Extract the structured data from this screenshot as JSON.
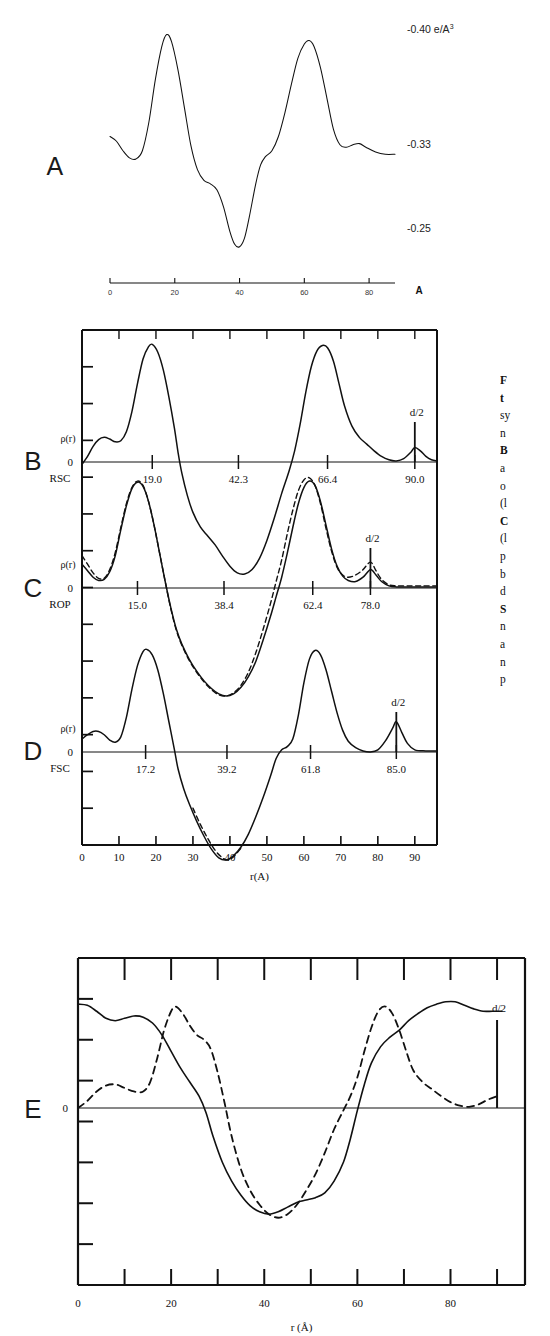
{
  "figure": {
    "title_letters": [
      "A",
      "B",
      "C",
      "D",
      "E"
    ],
    "axis_label_r": "r(A)",
    "axis_label_r_angstrom": "r (Å)",
    "zero_label": "0",
    "rho_label": "ρ(r)",
    "d_half_label": "d/2",
    "units_label": "-0.40 e/A",
    "units_exponent": "3"
  },
  "caption": {
    "lines": [
      "F",
      "t",
      "sy",
      "n",
      "B",
      "a",
      "o",
      "(l",
      "C",
      "(l",
      "p",
      "b",
      "d",
      "S",
      "n",
      "a",
      "n",
      "p"
    ],
    "bold_lines": [
      0,
      1,
      4,
      8,
      13
    ]
  },
  "panelA": {
    "letter": "A",
    "y_labels": [
      "-0.40 e/A",
      "-0.33",
      "-0.25"
    ],
    "y_label_sup": "3",
    "x_ticks": [
      0,
      20,
      40,
      60,
      80
    ],
    "x_tick_labels": [
      "0",
      "20",
      "40",
      "60",
      "80"
    ],
    "axis_unit": "A",
    "x_range": [
      0,
      88
    ],
    "curve": [
      [
        0,
        0.5
      ],
      [
        2,
        0.48
      ],
      [
        4,
        0.44
      ],
      [
        6,
        0.41
      ],
      [
        8,
        0.405
      ],
      [
        10,
        0.44
      ],
      [
        12,
        0.56
      ],
      [
        14,
        0.74
      ],
      [
        16,
        0.88
      ],
      [
        17.5,
        0.93
      ],
      [
        19,
        0.9
      ],
      [
        21,
        0.78
      ],
      [
        23,
        0.62
      ],
      [
        25,
        0.46
      ],
      [
        27,
        0.36
      ],
      [
        29,
        0.315
      ],
      [
        31,
        0.3
      ],
      [
        33,
        0.275
      ],
      [
        35,
        0.205
      ],
      [
        37,
        0.1
      ],
      [
        38.5,
        0.045
      ],
      [
        40,
        0.035
      ],
      [
        41.5,
        0.07
      ],
      [
        43,
        0.16
      ],
      [
        45,
        0.3
      ],
      [
        46.5,
        0.38
      ],
      [
        48,
        0.415
      ],
      [
        50,
        0.44
      ],
      [
        52,
        0.5
      ],
      [
        54,
        0.6
      ],
      [
        56,
        0.72
      ],
      [
        58,
        0.83
      ],
      [
        60,
        0.89
      ],
      [
        61.5,
        0.905
      ],
      [
        63,
        0.88
      ],
      [
        65,
        0.79
      ],
      [
        67,
        0.66
      ],
      [
        69,
        0.53
      ],
      [
        71,
        0.465
      ],
      [
        73,
        0.455
      ],
      [
        75,
        0.465
      ],
      [
        77,
        0.47
      ],
      [
        79,
        0.455
      ],
      [
        82,
        0.435
      ],
      [
        85,
        0.425
      ],
      [
        88,
        0.425
      ]
    ]
  },
  "panelB": {
    "letter": "B",
    "name": "RSC",
    "tick_values": [
      19.0,
      42.3,
      66.4,
      90.0
    ],
    "tick_labels": [
      "19.0",
      "42.3",
      "66.4",
      "90.0"
    ],
    "d_half": 90.0,
    "x_range": [
      0,
      96
    ],
    "y_range": [
      -1.0,
      1.15
    ],
    "curve": [
      [
        0,
        -0.02
      ],
      [
        1.5,
        0.05
      ],
      [
        3,
        0.14
      ],
      [
        4.5,
        0.2
      ],
      [
        6,
        0.22
      ],
      [
        7.5,
        0.205
      ],
      [
        9,
        0.18
      ],
      [
        10.5,
        0.19
      ],
      [
        12,
        0.27
      ],
      [
        13.5,
        0.45
      ],
      [
        15,
        0.7
      ],
      [
        16.5,
        0.92
      ],
      [
        18,
        1.03
      ],
      [
        19,
        1.05
      ],
      [
        20.5,
        0.98
      ],
      [
        22,
        0.82
      ],
      [
        23.5,
        0.58
      ],
      [
        25,
        0.3
      ],
      [
        26,
        0.08
      ],
      [
        27,
        -0.1
      ],
      [
        28.5,
        -0.3
      ],
      [
        30,
        -0.45
      ],
      [
        32,
        -0.58
      ],
      [
        34,
        -0.66
      ],
      [
        36,
        -0.74
      ],
      [
        38,
        -0.84
      ],
      [
        40,
        -0.93
      ],
      [
        42,
        -0.99
      ],
      [
        44,
        -1.0
      ],
      [
        46,
        -0.96
      ],
      [
        48,
        -0.86
      ],
      [
        50,
        -0.7
      ],
      [
        52,
        -0.5
      ],
      [
        54,
        -0.28
      ],
      [
        56,
        -0.08
      ],
      [
        57.5,
        0.1
      ],
      [
        59,
        0.34
      ],
      [
        60.5,
        0.62
      ],
      [
        62,
        0.85
      ],
      [
        63.5,
        0.99
      ],
      [
        65,
        1.04
      ],
      [
        66.4,
        1.02
      ],
      [
        68,
        0.9
      ],
      [
        69.5,
        0.7
      ],
      [
        71,
        0.5
      ],
      [
        73,
        0.32
      ],
      [
        75,
        0.22
      ],
      [
        77,
        0.16
      ],
      [
        79,
        0.1
      ],
      [
        81,
        0.05
      ],
      [
        83,
        0.02
      ],
      [
        85,
        0.01
      ],
      [
        87,
        0.03
      ],
      [
        89,
        0.09
      ],
      [
        90,
        0.13
      ],
      [
        91.5,
        0.1
      ],
      [
        93,
        0.05
      ],
      [
        94.5,
        0.02
      ],
      [
        96,
        0.01
      ]
    ]
  },
  "panelC": {
    "letter": "C",
    "name": "ROP",
    "tick_values": [
      15.0,
      38.4,
      62.4,
      78.0
    ],
    "tick_labels": [
      "15.0",
      "38.4",
      "62.4",
      "78.0"
    ],
    "d_half": 78.0,
    "x_range": [
      0,
      96
    ],
    "y_range": [
      -1.05,
      1.05
    ],
    "curve": [
      [
        0,
        0.22
      ],
      [
        1.5,
        0.16
      ],
      [
        3,
        0.1
      ],
      [
        4.5,
        0.07
      ],
      [
        6,
        0.08
      ],
      [
        7.5,
        0.15
      ],
      [
        9,
        0.3
      ],
      [
        10.5,
        0.54
      ],
      [
        12,
        0.76
      ],
      [
        13.5,
        0.92
      ],
      [
        15,
        0.98
      ],
      [
        16.5,
        0.94
      ],
      [
        18,
        0.8
      ],
      [
        19.5,
        0.58
      ],
      [
        21,
        0.32
      ],
      [
        22.5,
        0.06
      ],
      [
        24,
        -0.18
      ],
      [
        25.5,
        -0.38
      ],
      [
        27,
        -0.52
      ],
      [
        29,
        -0.66
      ],
      [
        31,
        -0.77
      ],
      [
        33,
        -0.86
      ],
      [
        35,
        -0.93
      ],
      [
        37,
        -0.98
      ],
      [
        39,
        -1.0
      ],
      [
        41,
        -0.98
      ],
      [
        43,
        -0.92
      ],
      [
        45,
        -0.82
      ],
      [
        47,
        -0.68
      ],
      [
        49,
        -0.48
      ],
      [
        51,
        -0.26
      ],
      [
        52.5,
        -0.08
      ],
      [
        54,
        0.1
      ],
      [
        55.5,
        0.32
      ],
      [
        57,
        0.56
      ],
      [
        58.5,
        0.78
      ],
      [
        60,
        0.93
      ],
      [
        61.5,
        0.99
      ],
      [
        63,
        0.95
      ],
      [
        64.5,
        0.8
      ],
      [
        66,
        0.58
      ],
      [
        67.5,
        0.36
      ],
      [
        69,
        0.2
      ],
      [
        70.5,
        0.11
      ],
      [
        72,
        0.07
      ],
      [
        74,
        0.06
      ],
      [
        76,
        0.1
      ],
      [
        78,
        0.17
      ],
      [
        79.5,
        0.12
      ],
      [
        81,
        0.06
      ],
      [
        83,
        0.02
      ],
      [
        85,
        0.01
      ],
      [
        88,
        0.01
      ],
      [
        92,
        0.01
      ],
      [
        96,
        0.01
      ]
    ],
    "curve_dashed": [
      [
        0,
        0.3
      ],
      [
        1.5,
        0.22
      ],
      [
        3,
        0.14
      ],
      [
        4.5,
        0.09
      ],
      [
        6,
        0.09
      ],
      [
        7.5,
        0.17
      ],
      [
        9,
        0.33
      ],
      [
        10.5,
        0.56
      ],
      [
        12,
        0.78
      ],
      [
        13.5,
        0.93
      ],
      [
        15,
        0.99
      ],
      [
        16.5,
        0.95
      ],
      [
        18,
        0.8
      ],
      [
        19.5,
        0.58
      ],
      [
        21,
        0.32
      ],
      [
        22.5,
        0.06
      ],
      [
        24,
        -0.19
      ],
      [
        25.5,
        -0.39
      ],
      [
        27,
        -0.53
      ],
      [
        29,
        -0.67
      ],
      [
        31,
        -0.78
      ],
      [
        33,
        -0.87
      ],
      [
        35,
        -0.94
      ],
      [
        37,
        -0.99
      ],
      [
        39,
        -1.0
      ],
      [
        41,
        -0.97
      ],
      [
        43,
        -0.9
      ],
      [
        45,
        -0.78
      ],
      [
        47,
        -0.6
      ],
      [
        49,
        -0.38
      ],
      [
        51,
        -0.14
      ],
      [
        52.5,
        0.06
      ],
      [
        54,
        0.26
      ],
      [
        55.5,
        0.5
      ],
      [
        57,
        0.72
      ],
      [
        58.5,
        0.9
      ],
      [
        60,
        1.0
      ],
      [
        61.5,
        1.02
      ],
      [
        63,
        0.95
      ],
      [
        64.5,
        0.78
      ],
      [
        66,
        0.55
      ],
      [
        67.5,
        0.34
      ],
      [
        69,
        0.19
      ],
      [
        70.5,
        0.12
      ],
      [
        72,
        0.1
      ],
      [
        74,
        0.12
      ],
      [
        76,
        0.17
      ],
      [
        78,
        0.24
      ],
      [
        79.5,
        0.16
      ],
      [
        81,
        0.08
      ],
      [
        83,
        0.03
      ],
      [
        85,
        0.02
      ],
      [
        88,
        0.02
      ],
      [
        92,
        0.02
      ],
      [
        96,
        0.02
      ]
    ]
  },
  "panelD": {
    "letter": "D",
    "name": "FSC",
    "tick_values": [
      17.2,
      39.2,
      61.8,
      85.0
    ],
    "tick_labels": [
      "17.2",
      "39.2",
      "61.8",
      "85.0"
    ],
    "d_half": 85.0,
    "x_range": [
      0,
      96
    ],
    "y_range": [
      -1.05,
      1.05
    ],
    "curve": [
      [
        0,
        0.12
      ],
      [
        1.5,
        0.16
      ],
      [
        3,
        0.19
      ],
      [
        4.5,
        0.19
      ],
      [
        6,
        0.16
      ],
      [
        7.5,
        0.11
      ],
      [
        9,
        0.09
      ],
      [
        10.5,
        0.14
      ],
      [
        12,
        0.32
      ],
      [
        13.5,
        0.58
      ],
      [
        15,
        0.8
      ],
      [
        16.5,
        0.93
      ],
      [
        17.5,
        0.95
      ],
      [
        19,
        0.9
      ],
      [
        20.5,
        0.76
      ],
      [
        22,
        0.54
      ],
      [
        23.5,
        0.28
      ],
      [
        25,
        0.02
      ],
      [
        26,
        -0.16
      ],
      [
        27.5,
        -0.34
      ],
      [
        29,
        -0.48
      ],
      [
        31,
        -0.64
      ],
      [
        33,
        -0.78
      ],
      [
        35,
        -0.9
      ],
      [
        37,
        -0.98
      ],
      [
        39,
        -1.0
      ],
      [
        41,
        -0.96
      ],
      [
        43,
        -0.88
      ],
      [
        45,
        -0.76
      ],
      [
        47,
        -0.6
      ],
      [
        49,
        -0.42
      ],
      [
        51,
        -0.22
      ],
      [
        52.5,
        -0.06
      ],
      [
        54,
        0.02
      ],
      [
        55.5,
        0.05
      ],
      [
        57,
        0.12
      ],
      [
        58.5,
        0.34
      ],
      [
        60,
        0.64
      ],
      [
        61.5,
        0.86
      ],
      [
        63,
        0.94
      ],
      [
        64.5,
        0.9
      ],
      [
        66,
        0.76
      ],
      [
        67.5,
        0.56
      ],
      [
        69,
        0.36
      ],
      [
        70.5,
        0.2
      ],
      [
        72,
        0.1
      ],
      [
        74,
        0.04
      ],
      [
        76,
        0.01
      ],
      [
        78,
        0.0
      ],
      [
        80,
        0.02
      ],
      [
        82,
        0.1
      ],
      [
        84,
        0.22
      ],
      [
        85,
        0.28
      ],
      [
        86.5,
        0.18
      ],
      [
        88,
        0.08
      ],
      [
        90,
        0.02
      ],
      [
        93,
        0.01
      ],
      [
        96,
        0.01
      ]
    ],
    "curve_dashed": [
      [
        30,
        -0.52
      ],
      [
        32,
        -0.67
      ],
      [
        34,
        -0.8
      ],
      [
        36,
        -0.91
      ],
      [
        38,
        -0.98
      ],
      [
        39.5,
        -1.0
      ],
      [
        41,
        -0.97
      ],
      [
        43,
        -0.89
      ]
    ]
  },
  "panelE": {
    "letter": "E",
    "x_ticks": [
      0,
      20,
      40,
      60,
      80
    ],
    "x_tick_labels": [
      "0",
      "20",
      "40",
      "60",
      "80"
    ],
    "x_minor_step": 10,
    "d_half": 90.0,
    "x_range": [
      0,
      96
    ],
    "y_range": [
      -1.05,
      1.05
    ],
    "curve_solid": [
      [
        0,
        0.88
      ],
      [
        2,
        0.87
      ],
      [
        4,
        0.82
      ],
      [
        6,
        0.76
      ],
      [
        8,
        0.74
      ],
      [
        10,
        0.76
      ],
      [
        12,
        0.78
      ],
      [
        14,
        0.77
      ],
      [
        16,
        0.72
      ],
      [
        18,
        0.62
      ],
      [
        20,
        0.48
      ],
      [
        22,
        0.34
      ],
      [
        24,
        0.22
      ],
      [
        26,
        0.1
      ],
      [
        27.5,
        -0.04
      ],
      [
        29,
        -0.24
      ],
      [
        31,
        -0.46
      ],
      [
        33,
        -0.62
      ],
      [
        35,
        -0.74
      ],
      [
        37,
        -0.83
      ],
      [
        39,
        -0.88
      ],
      [
        41,
        -0.9
      ],
      [
        43,
        -0.88
      ],
      [
        45,
        -0.84
      ],
      [
        47,
        -0.8
      ],
      [
        49,
        -0.78
      ],
      [
        51,
        -0.76
      ],
      [
        53,
        -0.72
      ],
      [
        55,
        -0.62
      ],
      [
        57,
        -0.46
      ],
      [
        58.5,
        -0.26
      ],
      [
        60,
        -0.02
      ],
      [
        61.5,
        0.2
      ],
      [
        63,
        0.38
      ],
      [
        65,
        0.52
      ],
      [
        67,
        0.6
      ],
      [
        69,
        0.66
      ],
      [
        71,
        0.74
      ],
      [
        73,
        0.8
      ],
      [
        75,
        0.85
      ],
      [
        77,
        0.88
      ],
      [
        79,
        0.9
      ],
      [
        81,
        0.9
      ],
      [
        83,
        0.87
      ],
      [
        85,
        0.84
      ],
      [
        87,
        0.82
      ],
      [
        89,
        0.82
      ],
      [
        91,
        0.82
      ]
    ],
    "curve_dashed": [
      [
        0,
        0.0
      ],
      [
        2,
        0.06
      ],
      [
        4,
        0.14
      ],
      [
        6,
        0.19
      ],
      [
        8,
        0.2
      ],
      [
        10,
        0.17
      ],
      [
        12,
        0.14
      ],
      [
        14,
        0.14
      ],
      [
        15.5,
        0.22
      ],
      [
        17,
        0.42
      ],
      [
        18.5,
        0.66
      ],
      [
        20,
        0.82
      ],
      [
        21,
        0.86
      ],
      [
        22.5,
        0.8
      ],
      [
        24,
        0.7
      ],
      [
        25.5,
        0.62
      ],
      [
        27,
        0.58
      ],
      [
        28.5,
        0.5
      ],
      [
        30,
        0.3
      ],
      [
        31.5,
        0.04
      ],
      [
        33,
        -0.24
      ],
      [
        35,
        -0.52
      ],
      [
        37,
        -0.7
      ],
      [
        39,
        -0.82
      ],
      [
        41,
        -0.9
      ],
      [
        43,
        -0.93
      ],
      [
        45,
        -0.9
      ],
      [
        47,
        -0.82
      ],
      [
        49,
        -0.7
      ],
      [
        51,
        -0.56
      ],
      [
        53,
        -0.38
      ],
      [
        55,
        -0.18
      ],
      [
        57,
        -0.02
      ],
      [
        58.5,
        0.1
      ],
      [
        60,
        0.26
      ],
      [
        61.5,
        0.48
      ],
      [
        63,
        0.68
      ],
      [
        64.5,
        0.82
      ],
      [
        66,
        0.86
      ],
      [
        67.5,
        0.8
      ],
      [
        69,
        0.66
      ],
      [
        70.5,
        0.48
      ],
      [
        72,
        0.32
      ],
      [
        74,
        0.22
      ],
      [
        76,
        0.16
      ],
      [
        78,
        0.1
      ],
      [
        80,
        0.05
      ],
      [
        82,
        0.02
      ],
      [
        84,
        0.01
      ],
      [
        86,
        0.03
      ],
      [
        88,
        0.07
      ],
      [
        90,
        0.1
      ]
    ]
  }
}
